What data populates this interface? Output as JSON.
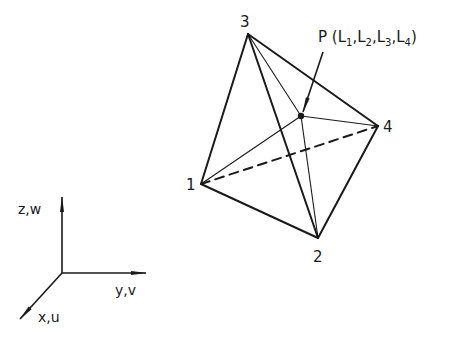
{
  "diagram": {
    "type": "tetrahedral element with point P in volume coordinates",
    "vertices": [
      {
        "id": "1",
        "label": "1",
        "x": 201,
        "y": 184
      },
      {
        "id": "2",
        "label": "2",
        "x": 318,
        "y": 238
      },
      {
        "id": "3",
        "label": "3",
        "x": 248,
        "y": 34
      },
      {
        "id": "4",
        "label": "4",
        "x": 378,
        "y": 126
      }
    ],
    "point": {
      "label_prefix": "P (L",
      "coords": [
        "1",
        "2",
        "3",
        "4"
      ],
      "full_label": "P (L1,L2,L3,L4)",
      "x": 301,
      "y": 116
    },
    "edges": [
      {
        "from": "1",
        "to": "3",
        "style": "solid"
      },
      {
        "from": "3",
        "to": "4",
        "style": "solid"
      },
      {
        "from": "3",
        "to": "2",
        "style": "solid"
      },
      {
        "from": "1",
        "to": "2",
        "style": "solid"
      },
      {
        "from": "2",
        "to": "4",
        "style": "solid"
      },
      {
        "from": "1",
        "to": "4",
        "style": "dashed"
      }
    ],
    "axes": {
      "z_label": "z,w",
      "y_label": "y,v",
      "x_label": "x,u"
    },
    "colors": {
      "ink": "#1a1a1a",
      "background": "#ffffff"
    }
  }
}
